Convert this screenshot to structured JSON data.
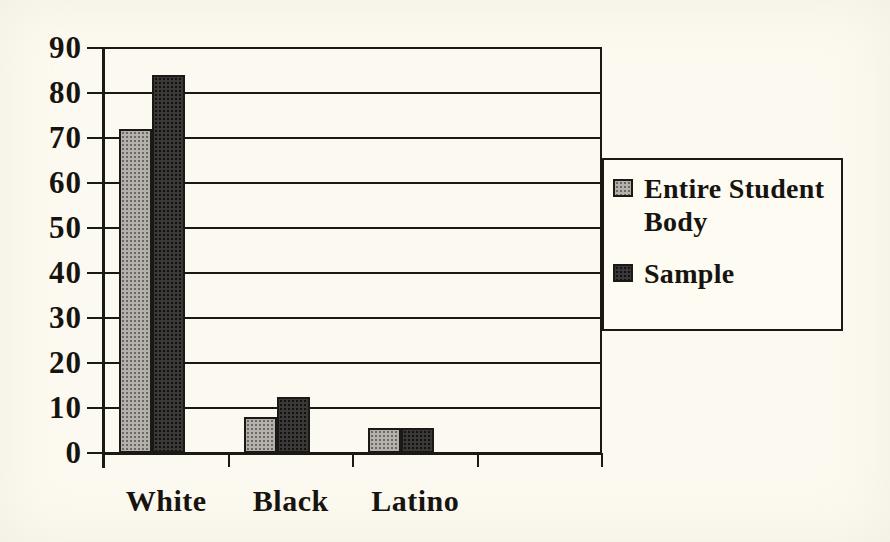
{
  "chart_data": {
    "type": "bar",
    "title": "",
    "xlabel": "",
    "ylabel": "",
    "categories": [
      "White",
      "Black",
      "Latino"
    ],
    "series": [
      {
        "name": "Entire Student Body",
        "values": [
          72,
          8,
          5.5
        ],
        "fill": "light"
      },
      {
        "name": "Sample",
        "values": [
          84,
          12.5,
          5.5
        ],
        "fill": "dark"
      }
    ],
    "ylim": [
      0,
      90
    ],
    "ytick_step": 10,
    "ytick_labels": [
      "90",
      "80",
      "70",
      "60",
      "50",
      "40",
      "30",
      "20",
      "10",
      "0"
    ],
    "category_slots": 4,
    "grid": true,
    "legend_position": "right"
  },
  "colors": {
    "background": "#fcfaf0",
    "line": "#1b1916",
    "text": "#171410",
    "series_light": "#b4b1ac",
    "series_light_dot": "#6b6863",
    "series_dark": "#3c3a38",
    "series_dark_dot": "#141210",
    "legend_background": "#fdfbf2"
  }
}
